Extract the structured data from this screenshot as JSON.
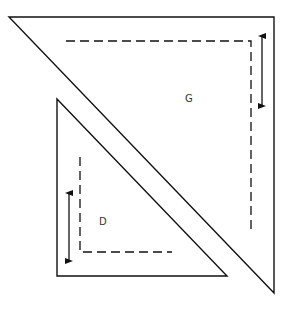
{
  "diagram": {
    "stroke_color": "#111111",
    "background": "#ffffff",
    "pieces": [
      {
        "id": "G",
        "label": "G",
        "outline": [
          [
            9,
            17
          ],
          [
            274,
            17
          ],
          [
            274,
            293
          ]
        ],
        "seam_line": [
          [
            66,
            41
          ],
          [
            251,
            41
          ],
          [
            251,
            234
          ]
        ],
        "label_pos": [
          185,
          102
        ],
        "grain_arrow": {
          "x": 262,
          "y1": 36,
          "y2": 106
        }
      },
      {
        "id": "D",
        "label": "D",
        "outline": [
          [
            57,
            99
          ],
          [
            57,
            276
          ],
          [
            227,
            276
          ]
        ],
        "seam_line": [
          [
            80,
            157
          ],
          [
            80,
            252
          ],
          [
            172,
            252
          ]
        ],
        "label_pos": [
          99,
          225
        ],
        "grain_arrow": {
          "x": 69,
          "y1": 193,
          "y2": 261
        }
      }
    ]
  }
}
